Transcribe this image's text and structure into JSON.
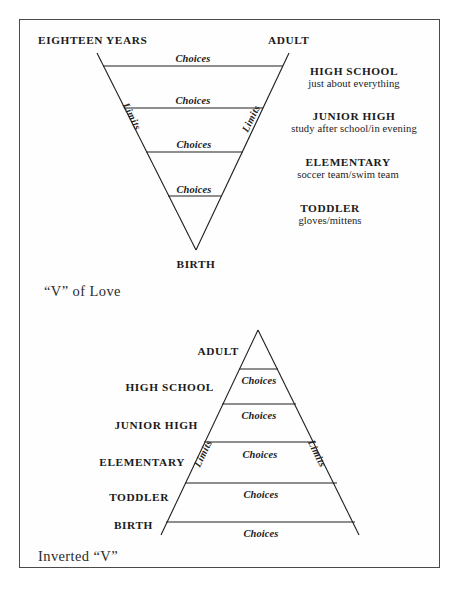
{
  "figure": {
    "title_top": "“V” of Love",
    "title_bottom": "Inverted “V”",
    "choices_label": "Choices",
    "limits_label": "Limits"
  },
  "top_diagram": {
    "name": "v-of-love",
    "top_left_label": "EIGHTEEN YEARS",
    "top_right_label": "ADULT",
    "bottom_label": "BIRTH",
    "caption": "“V” of Love",
    "bands": [
      {
        "choices": "Choices"
      },
      {
        "choices": "Choices"
      },
      {
        "choices": "Choices"
      },
      {
        "choices": "Choices"
      }
    ],
    "side_labels": [
      "Limits",
      "Limits"
    ],
    "stages": [
      {
        "name": "HIGH SCHOOL",
        "desc": "just about everything"
      },
      {
        "name": "JUNIOR HIGH",
        "desc": "study after school/in evening"
      },
      {
        "name": "ELEMENTARY",
        "desc": "soccer team/swim team"
      },
      {
        "name": "TODDLER",
        "desc": "gloves/mittens"
      }
    ]
  },
  "bottom_diagram": {
    "name": "inverted-v",
    "caption": "Inverted “V”",
    "stages": [
      "ADULT",
      "HIGH SCHOOL",
      "JUNIOR HIGH",
      "ELEMENTARY",
      "TODDLER",
      "BIRTH"
    ],
    "bands": [
      {
        "choices": "Choices"
      },
      {
        "choices": "Choices"
      },
      {
        "choices": "Choices"
      },
      {
        "choices": "Choices"
      },
      {
        "choices": "Choices"
      }
    ],
    "side_labels": [
      "Limits",
      "Limits"
    ]
  },
  "colors": {
    "ink": "#1f1f1f",
    "border": "#4a4a4a",
    "page": "#ffffff"
  }
}
